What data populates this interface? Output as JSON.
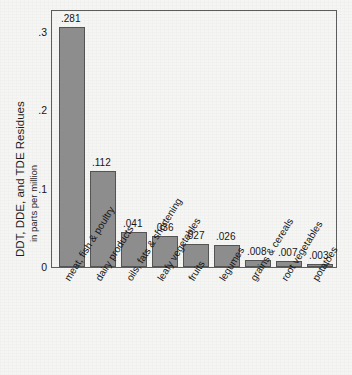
{
  "chart_data": {
    "type": "bar",
    "title": "",
    "xlabel": "",
    "ylabel": "DDT, DDE, and TDE Residues",
    "ylabel_sub": "in parts per million",
    "ylim": [
      0,
      0.3
    ],
    "yticks": [
      ".3",
      ".2",
      ".1",
      "0"
    ],
    "grid": false,
    "legend": null,
    "categories": [
      "meat, fish & poultry",
      "dairy products",
      "oils, fats & shortening",
      "leafy vegetables",
      "fruits",
      "legumes",
      "grains & cereals",
      "root vegetables",
      "potatoes"
    ],
    "values": [
      0.281,
      0.112,
      0.041,
      0.036,
      0.027,
      0.026,
      0.008,
      0.007,
      0.003
    ],
    "value_labels": [
      ".281",
      ".112",
      ".041",
      ".036",
      ".027",
      ".026",
      ".008",
      ".007",
      ".003"
    ],
    "colors": {
      "bar_fill": "#8d8d8d",
      "bar_edge": "#545454",
      "frame": "#5d5d5d",
      "text": "#161616",
      "background": "#f5f5f4"
    }
  }
}
